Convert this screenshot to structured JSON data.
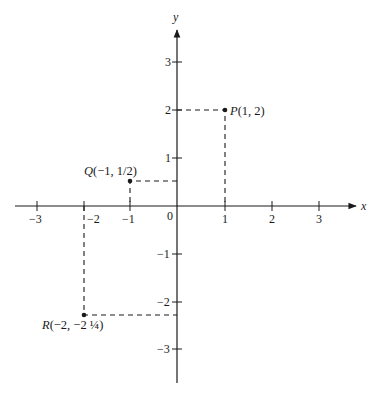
{
  "figure": {
    "x_axis_label": "x",
    "y_axis_label": "y",
    "origin_label": "0",
    "x_ticks": [
      {
        "value": -3,
        "label": "−3"
      },
      {
        "value": -2,
        "label": "−2"
      },
      {
        "value": -1,
        "label": "−1"
      },
      {
        "value": 1,
        "label": "1"
      },
      {
        "value": 2,
        "label": "2"
      },
      {
        "value": 3,
        "label": "3"
      }
    ],
    "y_ticks": [
      {
        "value": 3,
        "label": "3"
      },
      {
        "value": 2,
        "label": "2"
      },
      {
        "value": 1,
        "label": "1"
      },
      {
        "value": -1,
        "label": "−1"
      },
      {
        "value": -2,
        "label": "−2"
      },
      {
        "value": -3,
        "label": "−3"
      }
    ],
    "points": [
      {
        "name": "P",
        "coords": "(1, 2)",
        "x": 1,
        "y": 2
      },
      {
        "name": "Q",
        "coords": "(−1, 1/2)",
        "x": -1,
        "y": 0.5
      },
      {
        "name": "R",
        "coords": "(−2, −2 ¼)",
        "x": -2,
        "y": -2.25
      }
    ],
    "colors": {
      "ink": "#1a1a1a",
      "background": "#ffffff"
    }
  }
}
